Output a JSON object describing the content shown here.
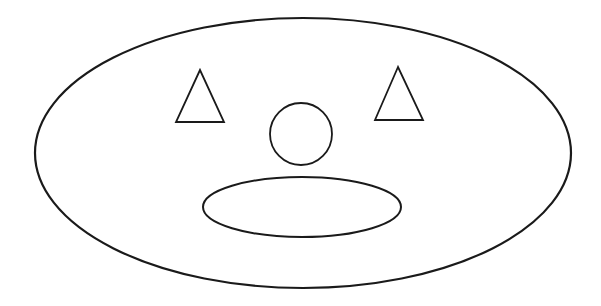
{
  "diagram": {
    "title": "",
    "background": "#ffffff",
    "stroke_color": "#1a1a1a",
    "shapes": {
      "face_outline": {
        "type": "ellipse",
        "cx": 303,
        "cy": 153,
        "rx": 268,
        "ry": 135,
        "stroke_width": 2.2
      },
      "left_eye": {
        "type": "triangle",
        "points": "200,70 176,122 224,122",
        "stroke_width": 1.8
      },
      "right_eye": {
        "type": "triangle",
        "points": "398,67 375,120 423,120",
        "stroke_width": 1.8
      },
      "nose": {
        "type": "circle",
        "cx": 301,
        "cy": 134,
        "r": 31,
        "stroke_width": 1.8
      },
      "mouth": {
        "type": "ellipse",
        "cx": 302,
        "cy": 207,
        "rx": 99,
        "ry": 30,
        "stroke_width": 2
      }
    },
    "labels": []
  }
}
